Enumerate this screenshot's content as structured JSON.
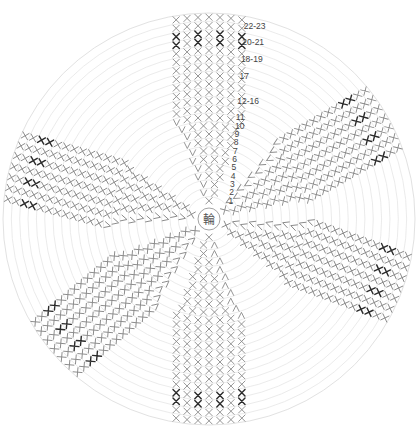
{
  "diagram": {
    "type": "crochet-round-chart",
    "center": {
      "x": 209,
      "y": 219,
      "label": "輪",
      "radius": 11
    },
    "outer_radius": 206,
    "ring_count": 23,
    "row_labels": [
      {
        "text": "1",
        "row": 1
      },
      {
        "text": "2",
        "row": 2
      },
      {
        "text": "3",
        "row": 3
      },
      {
        "text": "4",
        "row": 4
      },
      {
        "text": "5",
        "row": 5
      },
      {
        "text": "6",
        "row": 6
      },
      {
        "text": "7",
        "row": 7
      },
      {
        "text": "8",
        "row": 8
      },
      {
        "text": "9",
        "row": 9
      },
      {
        "text": "10",
        "row": 10
      },
      {
        "text": "11",
        "row": 11
      },
      {
        "text": "12-16",
        "row": 13
      },
      {
        "text": "17",
        "row": 16
      },
      {
        "text": "18-19",
        "row": 18
      },
      {
        "text": "20-21",
        "row": 20
      },
      {
        "text": "22-23",
        "row": 22
      }
    ],
    "sectors": [
      {
        "name": "top",
        "angle_deg": -90
      },
      {
        "name": "upper-right",
        "angle_deg": -30
      },
      {
        "name": "lower-right",
        "angle_deg": 20
      },
      {
        "name": "bottom",
        "angle_deg": 90
      },
      {
        "name": "lower-left",
        "angle_deg": 140
      },
      {
        "name": "left",
        "angle_deg": 195
      }
    ],
    "stitch_symbols": {
      "single_crochet": "X",
      "increase": "V",
      "decrease": "Λ",
      "highlight_color": "#2a2a2a",
      "stitch_color": "#8a8a8a",
      "ring_color": "#e6e6e6"
    }
  }
}
